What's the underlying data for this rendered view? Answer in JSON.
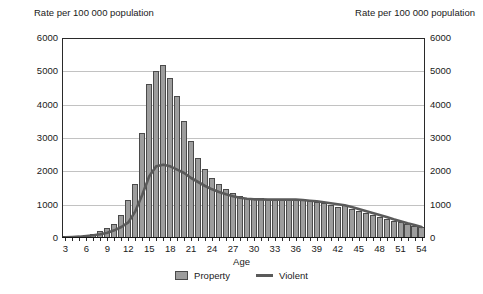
{
  "axis_titles": {
    "left": "Rate per 100 000 population",
    "right": "Rate per 100 000 population"
  },
  "xlabel": "Age",
  "legend": {
    "property_label": "Property",
    "violent_label": "Violent"
  },
  "colors": {
    "bar_fill": "#9d9d9d",
    "bar_edge": "#4a4a4a",
    "line": "#5a5a5a",
    "grid": "#c2c2c2",
    "frame": "#2a2a2a",
    "text": "#1a1a1a"
  },
  "chart_data": {
    "type": "bar",
    "title": "",
    "xlabel": "Age",
    "ylabel": "Rate per 100 000 population",
    "y2label": "Rate per 100 000 population",
    "ylim": [
      0,
      6000
    ],
    "xlim": [
      3,
      55
    ],
    "grid": true,
    "legend_position": "bottom",
    "ytick_labels": [
      "0",
      "1000",
      "2000",
      "3000",
      "4000",
      "5000",
      "6000"
    ],
    "ytick_values": [
      0,
      1000,
      2000,
      3000,
      4000,
      5000,
      6000
    ],
    "xtick_labels": [
      "3",
      "6",
      "9",
      "12",
      "15",
      "18",
      "21",
      "24",
      "27",
      "30",
      "33",
      "36",
      "39",
      "42",
      "45",
      "48",
      "51",
      "54"
    ],
    "xtick_values": [
      3,
      6,
      9,
      12,
      15,
      18,
      21,
      24,
      27,
      30,
      33,
      36,
      39,
      42,
      45,
      48,
      51,
      54
    ],
    "x": [
      3,
      4,
      5,
      6,
      7,
      8,
      9,
      10,
      11,
      12,
      13,
      14,
      15,
      16,
      17,
      18,
      19,
      20,
      21,
      22,
      23,
      24,
      25,
      26,
      27,
      28,
      29,
      30,
      31,
      32,
      33,
      34,
      35,
      36,
      37,
      38,
      39,
      40,
      41,
      42,
      43,
      44,
      45,
      46,
      47,
      48,
      49,
      50,
      51,
      52,
      53,
      54
    ],
    "series": [
      {
        "name": "Property",
        "type": "bar",
        "values": [
          30,
          40,
          60,
          90,
          130,
          200,
          300,
          420,
          700,
          1130,
          1620,
          3150,
          4620,
          5000,
          5200,
          4800,
          4250,
          3500,
          2900,
          2400,
          2080,
          1800,
          1620,
          1460,
          1340,
          1260,
          1200,
          1180,
          1200,
          1180,
          1160,
          1140,
          1160,
          1180,
          1160,
          1120,
          1080,
          1060,
          1000,
          940,
          1000,
          880,
          820,
          760,
          700,
          640,
          580,
          520,
          470,
          420,
          370,
          320
        ]
      },
      {
        "name": "Violent",
        "type": "line",
        "values": [
          20,
          30,
          40,
          60,
          80,
          110,
          160,
          230,
          330,
          470,
          800,
          1300,
          1850,
          2150,
          2200,
          2150,
          2050,
          1950,
          1800,
          1680,
          1560,
          1460,
          1380,
          1310,
          1250,
          1210,
          1180,
          1160,
          1160,
          1150,
          1150,
          1150,
          1150,
          1150,
          1140,
          1120,
          1100,
          1070,
          1040,
          1010,
          980,
          930,
          870,
          810,
          750,
          690,
          630,
          560,
          500,
          440,
          390,
          330
        ]
      }
    ]
  }
}
